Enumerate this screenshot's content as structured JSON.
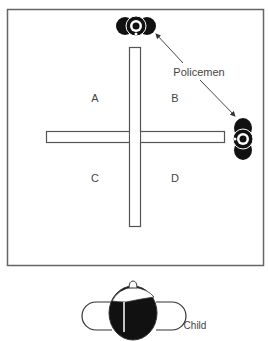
{
  "diagram": {
    "quadrant_labels": {
      "a": "A",
      "b": "B",
      "c": "C",
      "d": "D"
    },
    "policemen_label": "Policemen",
    "child_label": "Child",
    "colors": {
      "stroke": "#555555",
      "figure": "#111111",
      "background": "#ffffff"
    }
  }
}
